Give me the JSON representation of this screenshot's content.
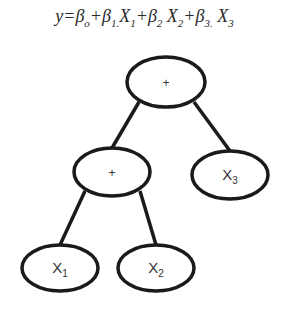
{
  "equation": {
    "parts": [
      {
        "text": "y=β",
        "sub": "o"
      },
      {
        "text": "+β",
        "sub": "1."
      },
      {
        "text": "X",
        "sub": "1"
      },
      {
        "text": "+β",
        "sub": "2"
      },
      {
        "text": " X",
        "sub": "2"
      },
      {
        "text": "+β",
        "sub": "3."
      },
      {
        "text": " X",
        "sub": "3"
      }
    ]
  },
  "tree": {
    "stroke_color": "#1a1a1a",
    "nodes": [
      {
        "id": "root",
        "label": "+",
        "sub": "",
        "cx": 166,
        "cy": 82,
        "rx": 39,
        "ry": 25
      },
      {
        "id": "plus",
        "label": "+",
        "sub": "",
        "cx": 112,
        "cy": 172,
        "rx": 38,
        "ry": 24
      },
      {
        "id": "x3",
        "label": "X",
        "sub": "3",
        "cx": 230,
        "cy": 175,
        "rx": 38,
        "ry": 24
      },
      {
        "id": "x1",
        "label": "X",
        "sub": "1",
        "cx": 60,
        "cy": 268,
        "rx": 38,
        "ry": 23
      },
      {
        "id": "x2",
        "label": "X",
        "sub": "2",
        "cx": 156,
        "cy": 268,
        "rx": 38,
        "ry": 23
      }
    ],
    "edges": [
      {
        "from": "root",
        "to": "plus",
        "x1": 139,
        "y1": 102,
        "x2": 112,
        "y2": 148
      },
      {
        "from": "root",
        "to": "x3",
        "x1": 194,
        "y1": 102,
        "x2": 230,
        "y2": 151
      },
      {
        "from": "plus",
        "to": "x1",
        "x1": 85,
        "y1": 191,
        "x2": 60,
        "y2": 245
      },
      {
        "from": "plus",
        "to": "x2",
        "x1": 140,
        "y1": 191,
        "x2": 156,
        "y2": 245
      }
    ]
  }
}
